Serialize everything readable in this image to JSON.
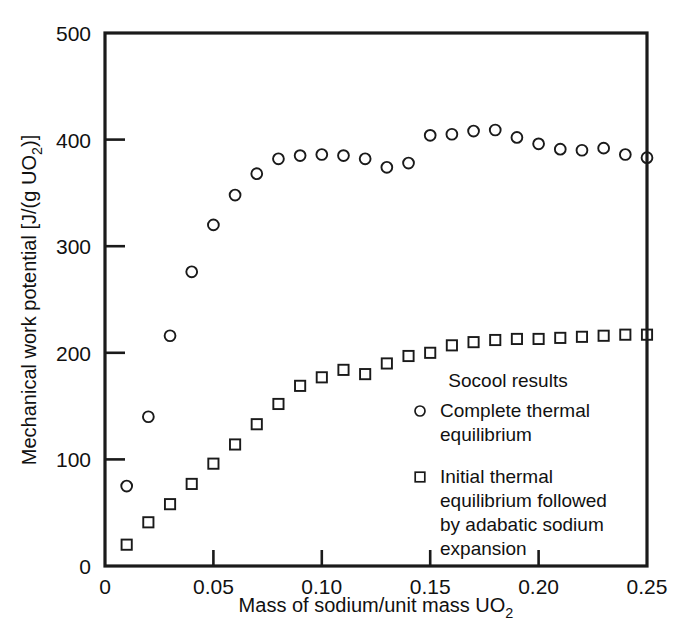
{
  "chart_data": {
    "type": "scatter",
    "title": "",
    "xlabel": "Mass of sodium/unit mass UO2",
    "xlabel_parts": {
      "main": "Mass of sodium/unit mass UO",
      "sub": "2"
    },
    "ylabel": "Mechanical work potential [J/(g UO2)]",
    "ylabel_parts": {
      "pre": "Mechanical work potential [J/(g UO",
      "sub": "2",
      "post": ")]"
    },
    "xlim": [
      0,
      0.25
    ],
    "ylim": [
      0,
      500
    ],
    "grid": false,
    "xticks": [
      0,
      0.05,
      0.1,
      0.15,
      0.2,
      0.25
    ],
    "xticklabels": [
      "0",
      "0.05",
      "0.10",
      "0.15",
      "0.20",
      "0.25"
    ],
    "yticks": [
      0,
      100,
      200,
      300,
      400,
      500
    ],
    "yticklabels": [
      "0",
      "100",
      "200",
      "300",
      "400",
      "500"
    ],
    "legend_position": "inside-lower-right",
    "legend_title": "Socool results",
    "series": [
      {
        "name": "Complete thermal equilibrium",
        "marker": "circle",
        "x": [
          0.01,
          0.02,
          0.03,
          0.04,
          0.05,
          0.06,
          0.07,
          0.08,
          0.09,
          0.1,
          0.11,
          0.12,
          0.13,
          0.14,
          0.15,
          0.16,
          0.17,
          0.18,
          0.19,
          0.2,
          0.21,
          0.22,
          0.23,
          0.24,
          0.25
        ],
        "y": [
          75,
          140,
          216,
          276,
          320,
          348,
          368,
          382,
          385,
          386,
          385,
          382,
          374,
          378,
          404,
          405,
          408,
          409,
          402,
          396,
          391,
          390,
          392,
          386,
          383
        ]
      },
      {
        "name": "Initial thermal equilibrium followed by adabatic sodium expansion",
        "marker": "square",
        "x": [
          0.01,
          0.02,
          0.03,
          0.04,
          0.05,
          0.06,
          0.07,
          0.08,
          0.09,
          0.1,
          0.11,
          0.12,
          0.13,
          0.14,
          0.15,
          0.16,
          0.17,
          0.18,
          0.19,
          0.2,
          0.21,
          0.22,
          0.23,
          0.24,
          0.25
        ],
        "y": [
          20,
          41,
          58,
          77,
          96,
          114,
          133,
          152,
          169,
          177,
          184,
          180,
          190,
          197,
          200,
          207,
          210,
          212,
          213,
          213,
          214,
          215,
          216,
          217,
          217
        ]
      }
    ]
  },
  "legend": {
    "title": "Socool results",
    "entries": [
      {
        "marker": "circle",
        "lines": [
          "Complete thermal",
          "equilibrium"
        ]
      },
      {
        "marker": "square",
        "lines": [
          "Initial thermal",
          "equilibrium followed",
          "by adabatic sodium",
          "expansion"
        ]
      }
    ]
  },
  "colors": {
    "axis": "#1a1a1a",
    "marker": "#1a1a1a",
    "background": "#ffffff",
    "text": "#111111"
  }
}
